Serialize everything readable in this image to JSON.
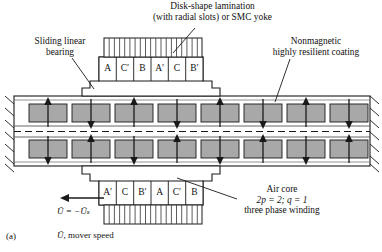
{
  "figure": {
    "caption": "(a)",
    "mover_speed_label": "mover speed",
    "speed_symbol": "Ū,",
    "speed_equation": "Ū = −Ūₛ"
  },
  "annotations": {
    "lamination": {
      "line1": "Disk-shape lamination",
      "line2": "(with radial slots) or SMC yoke"
    },
    "bearing": {
      "line1": "Sliding linear",
      "line2": "bearing"
    },
    "coating": {
      "line1": "Nonmagnetic",
      "line2": "highly resilient coating"
    },
    "air_core": {
      "line1": "Air core",
      "line2": "2p = 2; q = 1",
      "line3": "three phase winding"
    }
  },
  "windings": {
    "top_row": [
      "A",
      "C′",
      "B",
      "A′",
      "C",
      "B′"
    ],
    "bottom_row": [
      "A′",
      "C",
      "B′",
      "A",
      "C′",
      "B"
    ]
  },
  "secondary": {
    "magnet_count_per_row": 8,
    "top_arrow_directions": [
      "up",
      "down",
      "up",
      "down",
      "up",
      "down",
      "up",
      "down"
    ],
    "bottom_arrow_directions": [
      "down",
      "up",
      "down",
      "up",
      "down",
      "up",
      "down",
      "up"
    ],
    "magnet_fill": "#a8a8a8",
    "plate_fill": "#ffffff"
  },
  "colors": {
    "stroke": "#1a1a1a",
    "magnet": "#a8a8a8",
    "lamination_line": "#333333",
    "background": "#ffffff"
  },
  "geometry": {
    "lamination_slot_count_top": 18,
    "lamination_slot_count_bottom": 18
  }
}
